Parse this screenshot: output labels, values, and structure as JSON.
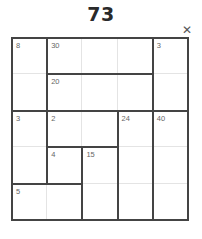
{
  "puzzle": {
    "number": "73",
    "close_icon": "close-icon",
    "grid_size": 5,
    "cages": [
      {
        "sum": "8",
        "cells": [
          [
            0,
            0
          ],
          [
            1,
            0
          ]
        ]
      },
      {
        "sum": "30",
        "cells": [
          [
            0,
            1
          ],
          [
            0,
            2
          ],
          [
            0,
            3
          ]
        ]
      },
      {
        "sum": "3",
        "cells": [
          [
            0,
            4
          ],
          [
            1,
            4
          ]
        ]
      },
      {
        "sum": "20",
        "cells": [
          [
            1,
            1
          ],
          [
            1,
            2
          ],
          [
            1,
            3
          ]
        ]
      },
      {
        "sum": "3",
        "cells": [
          [
            2,
            0
          ],
          [
            3,
            0
          ]
        ]
      },
      {
        "sum": "2",
        "cells": [
          [
            2,
            1
          ],
          [
            2,
            2
          ]
        ]
      },
      {
        "sum": "24",
        "cells": [
          [
            2,
            3
          ],
          [
            3,
            3
          ],
          [
            4,
            3
          ]
        ]
      },
      {
        "sum": "40",
        "cells": [
          [
            2,
            4
          ],
          [
            3,
            4
          ],
          [
            4,
            4
          ]
        ]
      },
      {
        "sum": "4",
        "cells": [
          [
            3,
            1
          ]
        ]
      },
      {
        "sum": "15",
        "cells": [
          [
            3,
            2
          ],
          [
            4,
            2
          ]
        ]
      },
      {
        "sum": "5",
        "cells": [
          [
            4,
            0
          ],
          [
            4,
            1
          ]
        ]
      }
    ]
  }
}
